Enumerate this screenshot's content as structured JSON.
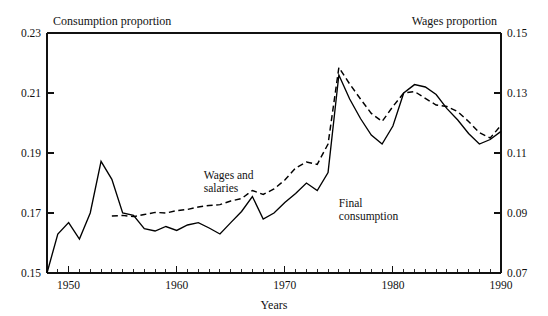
{
  "chart_data": {
    "type": "line",
    "title": "",
    "xlabel": "Years",
    "ylabel_left": "Consumption proportion",
    "ylabel_right": "Wages proportion",
    "grid": false,
    "legend_position": "inline-annotation",
    "xlim": [
      1948,
      1990
    ],
    "ylim_left": [
      0.15,
      0.23
    ],
    "ylim_right": [
      0.07,
      0.15
    ],
    "xticks_major": [
      1950,
      1960,
      1970,
      1980,
      1990
    ],
    "xticks_minor_step": 1,
    "yticks_left": [
      0.15,
      0.17,
      0.19,
      0.21,
      0.23
    ],
    "yticks_right": [
      0.07,
      0.09,
      0.11,
      0.13,
      0.15
    ],
    "ytick_labels_left": [
      "0.15",
      "0.17",
      "0.19",
      "0.21",
      "0.23"
    ],
    "ytick_labels_right": [
      "0.07",
      "0.09",
      "0.11",
      "0.13",
      "0.15"
    ],
    "xtick_labels": [
      "1950",
      "1960",
      "1970",
      "1980",
      "1990"
    ],
    "series": [
      {
        "name": "Final consumption",
        "style": "solid",
        "axis": "left",
        "annotation": "Final\nconsumption",
        "annotation_lines": [
          "Final",
          "consumption"
        ],
        "x": [
          1948,
          1949,
          1950,
          1951,
          1952,
          1953,
          1954,
          1955,
          1956,
          1957,
          1958,
          1959,
          1960,
          1961,
          1962,
          1963,
          1964,
          1965,
          1966,
          1967,
          1968,
          1969,
          1970,
          1971,
          1972,
          1973,
          1974,
          1975,
          1976,
          1977,
          1978,
          1979,
          1980,
          1981,
          1982,
          1983,
          1984,
          1985,
          1986,
          1987,
          1988,
          1989,
          1990
        ],
        "y": [
          0.15,
          0.163,
          0.1668,
          0.1613,
          0.17,
          0.1872,
          0.1812,
          0.17,
          0.1692,
          0.1648,
          0.164,
          0.1655,
          0.1642,
          0.166,
          0.1668,
          0.165,
          0.163,
          0.1668,
          0.1705,
          0.1755,
          0.168,
          0.17,
          0.1735,
          0.1765,
          0.18,
          0.1775,
          0.1835,
          0.216,
          0.208,
          0.2015,
          0.196,
          0.193,
          0.199,
          0.21,
          0.2128,
          0.212,
          0.2095,
          0.2048,
          0.201,
          0.1965,
          0.193,
          0.1945,
          0.1972
        ]
      },
      {
        "name": "Wages and salaries",
        "style": "dashed",
        "axis": "right",
        "annotation": "Wages and\nsalaries",
        "annotation_lines": [
          "Wages and",
          "salaries"
        ],
        "x": [
          1954,
          1955,
          1956,
          1957,
          1958,
          1959,
          1960,
          1961,
          1962,
          1963,
          1964,
          1965,
          1966,
          1967,
          1968,
          1969,
          1970,
          1971,
          1972,
          1973,
          1974,
          1975,
          1976,
          1977,
          1978,
          1979,
          1980,
          1981,
          1982,
          1983,
          1984,
          1985,
          1986,
          1987,
          1988,
          1989,
          1990
        ],
        "y": [
          0.089,
          0.0892,
          0.0888,
          0.0895,
          0.0902,
          0.09,
          0.0908,
          0.0912,
          0.092,
          0.0925,
          0.0928,
          0.094,
          0.0948,
          0.0975,
          0.0962,
          0.098,
          0.101,
          0.105,
          0.107,
          0.1062,
          0.113,
          0.1385,
          0.133,
          0.128,
          0.1232,
          0.1205,
          0.1255,
          0.13,
          0.1305,
          0.1282,
          0.126,
          0.1255,
          0.1238,
          0.1205,
          0.1168,
          0.115,
          0.1192
        ]
      }
    ],
    "annotations": [
      {
        "text_lines": [
          "Wages and",
          "salaries"
        ],
        "x": 1962.5,
        "y_left": 0.1815
      },
      {
        "text_lines": [
          "Final",
          "consumption"
        ],
        "x": 1975.0,
        "y_left": 0.172
      }
    ]
  }
}
